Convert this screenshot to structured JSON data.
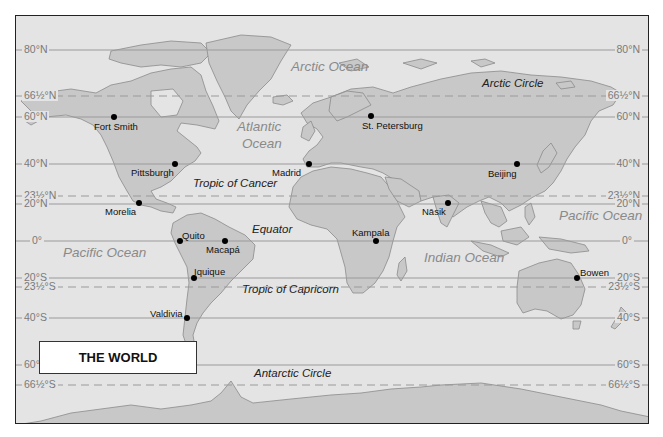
{
  "map": {
    "title": "THE WORLD",
    "colors": {
      "ocean": "#e4e4e4",
      "land": "#c8c8c8",
      "coast": "#8a8a8a",
      "lat_line": "#9a9a9a",
      "frame": "#222222"
    },
    "latitudes": [
      {
        "label": "80°N",
        "y": 49,
        "dashed": false
      },
      {
        "label": "66½°N",
        "y": 95,
        "dashed": true
      },
      {
        "label": "60°N",
        "y": 116,
        "dashed": false
      },
      {
        "label": "40°N",
        "y": 163,
        "dashed": false
      },
      {
        "label": "23½°N",
        "y": 195,
        "dashed": true
      },
      {
        "label": "20°N",
        "y": 203,
        "dashed": false
      },
      {
        "label": "0°",
        "y": 240,
        "dashed": false
      },
      {
        "label": "20°S",
        "y": 277,
        "dashed": false
      },
      {
        "label": "23½°S",
        "y": 286,
        "dashed": true
      },
      {
        "label": "40°S",
        "y": 317,
        "dashed": false
      },
      {
        "label": "60°S",
        "y": 364,
        "dashed": false
      },
      {
        "label": "66½°S",
        "y": 384,
        "dashed": true
      }
    ],
    "oceans": [
      {
        "label": "Arctic Ocean",
        "x": 290,
        "y": 65
      },
      {
        "label": "Atlantic",
        "x": 236,
        "y": 125
      },
      {
        "label": "Ocean",
        "x": 241,
        "y": 142
      },
      {
        "label": "Pacific Ocean",
        "x": 62,
        "y": 251
      },
      {
        "label": "Indian Ocean",
        "x": 423,
        "y": 256
      },
      {
        "label": "Pacific Ocean",
        "x": 558,
        "y": 214
      }
    ],
    "line_names": [
      {
        "label": "Arctic Circle",
        "x": 481,
        "y": 82
      },
      {
        "label": "Tropic of Cancer",
        "x": 192,
        "y": 182
      },
      {
        "label": "Equator",
        "x": 251,
        "y": 228
      },
      {
        "label": "Tropic of Capricorn",
        "x": 241,
        "y": 288
      },
      {
        "label": "Antarctic Circle",
        "x": 253,
        "y": 372
      }
    ],
    "cities": [
      {
        "name": "Fort Smith",
        "dot_x": 113,
        "dot_y": 116,
        "label_x": 93,
        "label_y": 120
      },
      {
        "name": "St. Petersburg",
        "dot_x": 370,
        "dot_y": 115,
        "label_x": 361,
        "label_y": 119
      },
      {
        "name": "Pittsburgh",
        "dot_x": 174,
        "dot_y": 163,
        "label_x": 130,
        "label_y": 166
      },
      {
        "name": "Madrid",
        "dot_x": 308,
        "dot_y": 163,
        "label_x": 271,
        "label_y": 166
      },
      {
        "name": "Beijing",
        "dot_x": 516,
        "dot_y": 163,
        "label_x": 487,
        "label_y": 167
      },
      {
        "name": "Morelia",
        "dot_x": 138,
        "dot_y": 202,
        "label_x": 104,
        "label_y": 205
      },
      {
        "name": "Nāsik",
        "dot_x": 447,
        "dot_y": 202,
        "label_x": 421,
        "label_y": 205
      },
      {
        "name": "Quito",
        "dot_x": 179,
        "dot_y": 240,
        "label_x": 181,
        "label_y": 230
      },
      {
        "name": "Macapá",
        "dot_x": 224,
        "dot_y": 240,
        "label_x": 205,
        "label_y": 243
      },
      {
        "name": "Kampala",
        "dot_x": 375,
        "dot_y": 240,
        "label_x": 351,
        "label_y": 227
      },
      {
        "name": "Iquique",
        "dot_x": 193,
        "dot_y": 277,
        "label_x": 193,
        "label_y": 266
      },
      {
        "name": "Bowen",
        "dot_x": 576,
        "dot_y": 277,
        "label_x": 579,
        "label_y": 266
      },
      {
        "name": "Valdivia",
        "dot_x": 186,
        "dot_y": 317,
        "label_x": 149,
        "label_y": 308
      }
    ]
  }
}
